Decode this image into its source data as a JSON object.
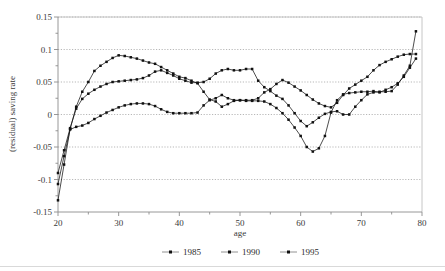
{
  "chart_data": {
    "type": "line",
    "title": "",
    "xlabel": "age",
    "ylabel": "(residual) saving rate",
    "xlim": [
      20,
      80
    ],
    "ylim": [
      -0.15,
      0.15
    ],
    "xticks": [
      20,
      25,
      30,
      35,
      40,
      45,
      50,
      55,
      60,
      65,
      70,
      75,
      80
    ],
    "xtick_labels": [
      "20",
      "",
      "30",
      "",
      "40",
      "",
      "50",
      "",
      "60",
      "",
      "70",
      "",
      "80"
    ],
    "yticks": [
      -0.15,
      -0.125,
      -0.1,
      -0.075,
      -0.05,
      -0.025,
      0,
      0.025,
      0.05,
      0.075,
      0.1,
      0.125,
      0.15
    ],
    "ytick_labels": [
      "-0.15",
      "",
      "-0.1",
      "",
      "-0.05",
      "",
      "0",
      "",
      "0.05",
      "",
      "0.1",
      "",
      "0.15"
    ],
    "grid": true,
    "grid_axis": "y",
    "legend_position": "bottom",
    "marker": "square",
    "line_color": "#111111",
    "x": [
      20,
      21,
      22,
      23,
      24,
      25,
      26,
      27,
      28,
      29,
      30,
      31,
      32,
      33,
      34,
      35,
      36,
      37,
      38,
      39,
      40,
      41,
      42,
      43,
      44,
      45,
      46,
      47,
      48,
      49,
      50,
      51,
      52,
      53,
      54,
      55,
      56,
      57,
      58,
      59,
      60,
      61,
      62,
      63,
      64,
      65,
      66,
      67,
      68,
      69,
      70,
      71,
      72,
      73,
      74,
      75,
      76,
      77,
      78,
      79
    ],
    "series": [
      {
        "name": "1985",
        "values": [
          -0.132,
          -0.077,
          -0.022,
          0.012,
          0.035,
          0.05,
          0.067,
          0.075,
          0.081,
          0.087,
          0.091,
          0.09,
          0.088,
          0.086,
          0.083,
          0.08,
          0.078,
          0.073,
          0.068,
          0.063,
          0.058,
          0.056,
          0.052,
          0.048,
          0.035,
          0.023,
          0.02,
          0.012,
          0.016,
          0.021,
          0.022,
          0.022,
          0.022,
          0.025,
          0.034,
          0.039,
          0.047,
          0.053,
          0.049,
          0.043,
          0.037,
          0.03,
          0.023,
          0.017,
          0.013,
          0.011,
          0.018,
          0.03,
          0.04,
          0.046,
          0.052,
          0.058,
          0.068,
          0.076,
          0.081,
          0.085,
          0.089,
          0.092,
          0.093,
          0.093
        ]
      },
      {
        "name": "1990",
        "values": [
          -0.09,
          -0.055,
          -0.021,
          0.009,
          0.024,
          0.032,
          0.038,
          0.043,
          0.047,
          0.05,
          0.051,
          0.052,
          0.053,
          0.054,
          0.056,
          0.06,
          0.066,
          0.068,
          0.064,
          0.06,
          0.055,
          0.052,
          0.049,
          0.049,
          0.05,
          0.055,
          0.063,
          0.068,
          0.07,
          0.068,
          0.068,
          0.07,
          0.07,
          0.052,
          0.042,
          0.036,
          0.029,
          0.024,
          0.014,
          0.002,
          -0.01,
          -0.018,
          -0.012,
          -0.005,
          0.001,
          0.004,
          0.005,
          0.0,
          0.0,
          0.012,
          0.022,
          0.031,
          0.034,
          0.035,
          0.035,
          0.036,
          0.046,
          0.06,
          0.075,
          0.128
        ]
      },
      {
        "name": "1995",
        "values": [
          -0.107,
          -0.064,
          -0.023,
          -0.019,
          -0.017,
          -0.013,
          -0.007,
          -0.002,
          0.003,
          0.007,
          0.011,
          0.014,
          0.016,
          0.017,
          0.017,
          0.016,
          0.013,
          0.008,
          0.004,
          0.002,
          0.002,
          0.002,
          0.002,
          0.003,
          0.014,
          0.022,
          0.025,
          0.03,
          0.025,
          0.022,
          0.022,
          0.021,
          0.021,
          0.021,
          0.02,
          0.016,
          0.01,
          0.002,
          -0.008,
          -0.02,
          -0.033,
          -0.05,
          -0.057,
          -0.052,
          -0.033,
          0.003,
          0.022,
          0.031,
          0.033,
          0.034,
          0.035,
          0.035,
          0.036,
          0.034,
          0.038,
          0.042,
          0.048,
          0.058,
          0.072,
          0.086
        ]
      }
    ]
  },
  "axis": {
    "y_title": "(residual) saving rate",
    "x_title": "age"
  },
  "legend": {
    "entries": [
      {
        "label": "1985"
      },
      {
        "label": "1990"
      },
      {
        "label": "1995"
      }
    ]
  }
}
